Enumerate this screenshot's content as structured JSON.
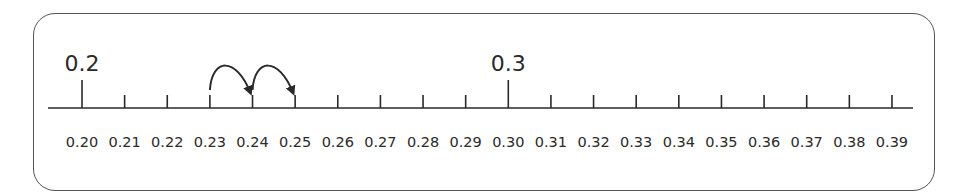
{
  "number_line": {
    "start": 0.2,
    "end": 0.39,
    "step": 0.01,
    "tick_labels": [
      "0.20",
      "0.21",
      "0.22",
      "0.23",
      "0.24",
      "0.25",
      "0.26",
      "0.27",
      "0.28",
      "0.29",
      "0.30",
      "0.31",
      "0.32",
      "0.33",
      "0.34",
      "0.35",
      "0.36",
      "0.37",
      "0.38",
      "0.39"
    ],
    "major_labels": [
      {
        "value": "0.2",
        "index": 0
      },
      {
        "value": "0.3",
        "index": 10
      }
    ],
    "jumps": [
      {
        "from": "0.23",
        "to": "0.24",
        "from_index": 3,
        "to_index": 4
      },
      {
        "from": "0.24",
        "to": "0.25",
        "from_index": 4,
        "to_index": 5
      }
    ]
  },
  "colors": {
    "ink": "#2a2a2a",
    "frame": "#555555"
  }
}
